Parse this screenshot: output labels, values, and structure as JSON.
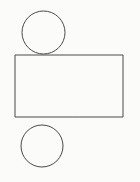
{
  "document": {
    "title": "Geometric Line Drawing",
    "canvas_width": 140,
    "canvas_height": 182,
    "background_color": "#fbfbf9",
    "stroke_color": "#4a4a4a",
    "stroke_width": 1,
    "fill": "none"
  },
  "figure": {
    "shape_count": 3,
    "shapes": [
      {
        "id": "circle-top",
        "type": "circle",
        "label": "Top circle",
        "cx": 43.5,
        "cy": 32.5,
        "r": 21.5,
        "diameter": 43,
        "bounds": {
          "left": 22,
          "top": 11,
          "right": 65,
          "bottom": 54
        }
      },
      {
        "id": "rectangle-middle",
        "type": "rectangle",
        "label": "Middle rectangle",
        "x": 15,
        "y": 55,
        "width": 108,
        "height": 62,
        "bounds": {
          "left": 15,
          "top": 55,
          "right": 123,
          "bottom": 117
        }
      },
      {
        "id": "circle-bottom",
        "type": "circle",
        "label": "Bottom circle",
        "cx": 42,
        "cy": 146,
        "r": 21,
        "diameter": 42,
        "bounds": {
          "left": 21,
          "top": 125,
          "right": 63,
          "bottom": 167
        }
      }
    ]
  }
}
